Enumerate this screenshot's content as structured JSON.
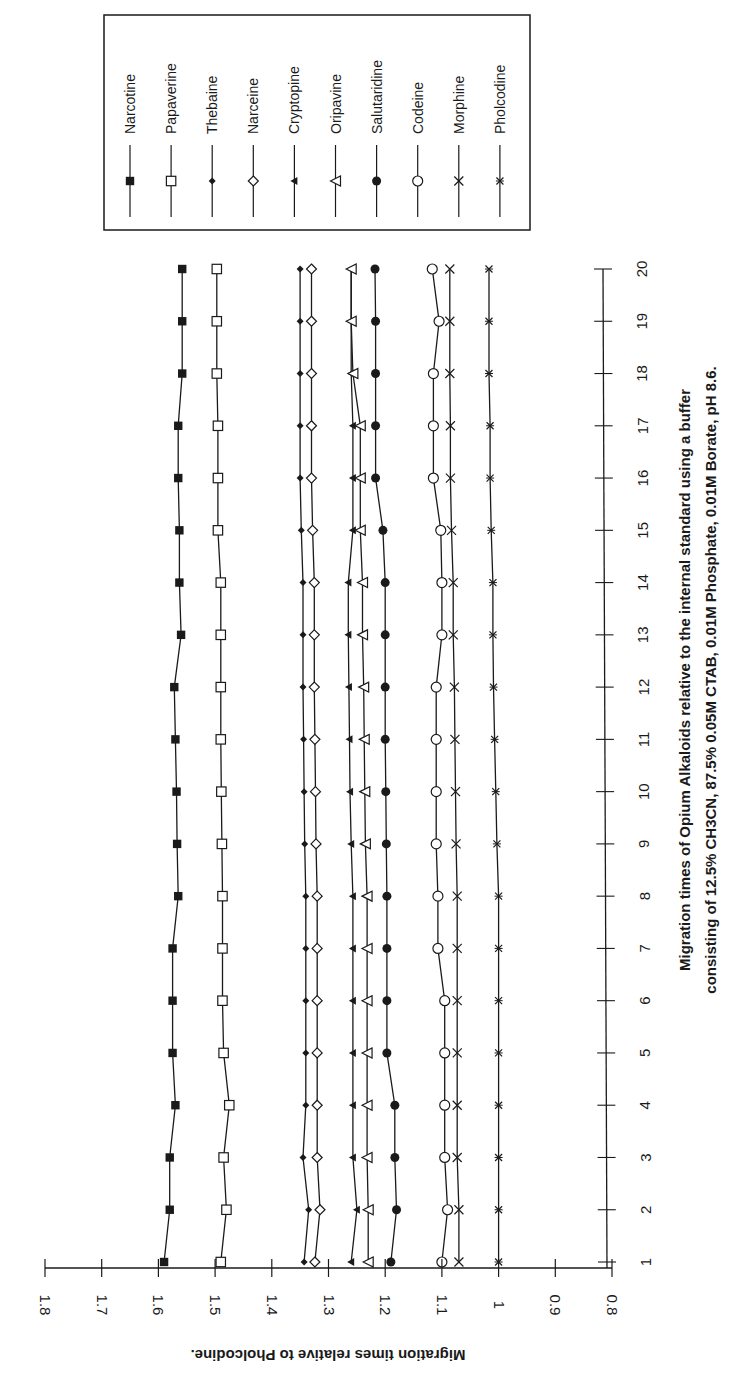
{
  "chart_data": {
    "type": "line",
    "orientation": "rotated-90-ccw",
    "title_lines": [
      "Migration times of Opium Alkaloids relative to the internal standard using a buffer",
      "consisting of 12.5% CH3CN, 87.5% 0.05M CTAB, 0.01M Phosphate, 0.01M Borate, pH 8.6."
    ],
    "xlabel": "",
    "ylabel": "Migration times relative to Pholcodine.",
    "x": [
      1,
      2,
      3,
      4,
      5,
      6,
      7,
      8,
      9,
      10,
      11,
      12,
      13,
      14,
      15,
      16,
      17,
      18,
      19,
      20
    ],
    "x_tick_labels": [
      "1",
      "2",
      "3",
      "4",
      "5",
      "6",
      "7",
      "8",
      "9",
      "10",
      "11",
      "12",
      "13",
      "14",
      "15",
      "16",
      "17",
      "18",
      "19",
      "20"
    ],
    "y_tick_labels": [
      "0.8",
      "0.9",
      "1",
      "1.1",
      "1.2",
      "1.3",
      "1.4",
      "1.5",
      "1.6",
      "1.7",
      "1.8"
    ],
    "y_ticks": [
      0.8,
      0.9,
      1.0,
      1.1,
      1.2,
      1.3,
      1.4,
      1.5,
      1.6,
      1.7,
      1.8
    ],
    "ylim": [
      0.8,
      1.8
    ],
    "xlim": [
      1,
      20
    ],
    "grid": false,
    "legend_position": "top-right (rotated)",
    "series": [
      {
        "name": "Narcotine",
        "marker": "filled-square",
        "values": [
          1.59,
          1.58,
          1.58,
          1.57,
          1.575,
          1.575,
          1.575,
          1.565,
          1.567,
          1.568,
          1.57,
          1.572,
          1.56,
          1.563,
          1.563,
          1.565,
          1.565,
          1.558,
          1.558,
          1.558
        ]
      },
      {
        "name": "Papaverine",
        "marker": "open-square",
        "values": [
          1.49,
          1.48,
          1.485,
          1.475,
          1.485,
          1.487,
          1.487,
          1.487,
          1.488,
          1.489,
          1.49,
          1.49,
          1.49,
          1.49,
          1.495,
          1.495,
          1.495,
          1.497,
          1.497,
          1.497
        ]
      },
      {
        "name": "Thebaine",
        "marker": "filled-diamond",
        "values": [
          1.343,
          1.335,
          1.345,
          1.34,
          1.34,
          1.34,
          1.34,
          1.34,
          1.342,
          1.343,
          1.344,
          1.345,
          1.345,
          1.345,
          1.348,
          1.35,
          1.35,
          1.35,
          1.35,
          1.35
        ]
      },
      {
        "name": "Narceine",
        "marker": "open-diamond",
        "values": [
          1.324,
          1.315,
          1.32,
          1.32,
          1.32,
          1.32,
          1.32,
          1.32,
          1.322,
          1.323,
          1.324,
          1.325,
          1.325,
          1.325,
          1.328,
          1.33,
          1.33,
          1.33,
          1.33,
          1.33
        ]
      },
      {
        "name": "Cryptopine",
        "marker": "filled-triangle",
        "values": [
          1.26,
          1.25,
          1.257,
          1.257,
          1.257,
          1.257,
          1.257,
          1.257,
          1.26,
          1.262,
          1.263,
          1.264,
          1.265,
          1.265,
          1.257,
          1.257,
          1.257,
          1.26,
          1.26,
          1.26
        ]
      },
      {
        "name": "Oripavine",
        "marker": "open-triangle",
        "values": [
          1.23,
          1.23,
          1.232,
          1.232,
          1.232,
          1.232,
          1.232,
          1.232,
          1.235,
          1.236,
          1.237,
          1.238,
          1.24,
          1.24,
          1.244,
          1.244,
          1.244,
          1.257,
          1.26,
          1.26
        ]
      },
      {
        "name": "Salutaridine",
        "marker": "filled-circle",
        "values": [
          1.19,
          1.18,
          1.183,
          1.183,
          1.197,
          1.197,
          1.197,
          1.197,
          1.198,
          1.199,
          1.2,
          1.2,
          1.2,
          1.2,
          1.204,
          1.217,
          1.217,
          1.217,
          1.217,
          1.218
        ]
      },
      {
        "name": "Codeine",
        "marker": "open-circle",
        "values": [
          1.1,
          1.09,
          1.095,
          1.095,
          1.095,
          1.095,
          1.107,
          1.107,
          1.11,
          1.11,
          1.11,
          1.11,
          1.1,
          1.1,
          1.102,
          1.115,
          1.115,
          1.115,
          1.105,
          1.117
        ]
      },
      {
        "name": "Morphine",
        "marker": "x",
        "values": [
          1.07,
          1.07,
          1.073,
          1.073,
          1.073,
          1.073,
          1.073,
          1.073,
          1.075,
          1.076,
          1.077,
          1.078,
          1.08,
          1.08,
          1.083,
          1.085,
          1.085,
          1.086,
          1.086,
          1.086
        ]
      },
      {
        "name": "Pholcodine",
        "marker": "star-x",
        "values": [
          1.0,
          1.0,
          1.0,
          1.0,
          1.0,
          1.0,
          1.0,
          1.0,
          1.003,
          1.005,
          1.007,
          1.009,
          1.01,
          1.01,
          1.013,
          1.015,
          1.015,
          1.017,
          1.017,
          1.017
        ]
      }
    ]
  },
  "legend": {
    "items": [
      {
        "label": "Narcotine"
      },
      {
        "label": "Papaverine"
      },
      {
        "label": "Thebaine"
      },
      {
        "label": "Narceine"
      },
      {
        "label": "Cryptopine"
      },
      {
        "label": "Oripavine"
      },
      {
        "label": "Salutaridine"
      },
      {
        "label": "Codeine"
      },
      {
        "label": "Morphine"
      },
      {
        "label": "Pholcodine"
      }
    ]
  },
  "colors": {
    "ink": "#1a1a1a",
    "background": "#ffffff"
  }
}
